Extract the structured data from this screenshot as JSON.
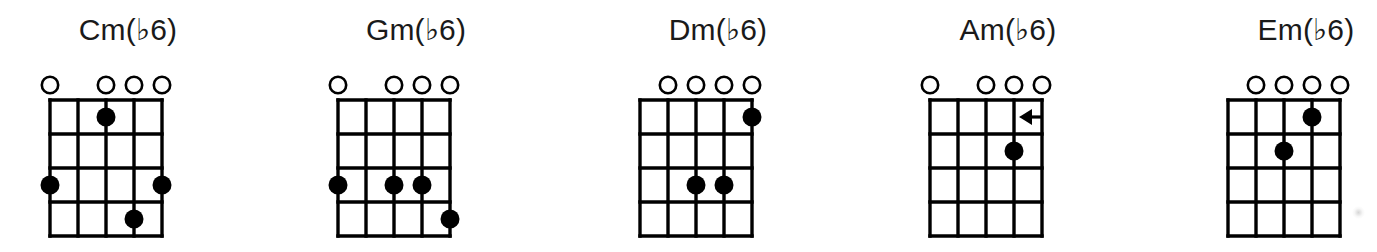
{
  "figure": {
    "title_visible": false,
    "accent_color": "#000000",
    "background_color": "#ffffff",
    "text_color": "#1a1a1a"
  },
  "chart_data": {
    "type": "table",
    "title": "",
    "subtitle": "",
    "xlabel": "",
    "ylabel": "",
    "grid": true,
    "legend_position": "none",
    "notation": "guitar chord diagram grid",
    "strings_count": 5,
    "frets_count": 4,
    "marker_legend": {
      "open_circle": "open string (played unfretted)",
      "filled_dot": "fretted note",
      "left_arrow": "slide / approach note from above"
    },
    "categories": [
      "Cm(b6)",
      "Gm(b6)",
      "Dm(b6)",
      "Am(b6)",
      "Em(b6)"
    ],
    "series": [
      {
        "name": "open_strings_count",
        "values": [
          4,
          4,
          4,
          4,
          4
        ]
      },
      {
        "name": "fretted_notes_count",
        "values": [
          4,
          4,
          3,
          1,
          2
        ]
      }
    ],
    "diagrams": [
      {
        "name": "Cm(b6)",
        "open_strings": [
          1,
          3,
          4,
          5
        ],
        "dots": [
          {
            "fret": 1,
            "string": 3
          },
          {
            "fret": 3,
            "string": 1
          },
          {
            "fret": 3,
            "string": 5
          },
          {
            "fret": 4,
            "string": 4
          }
        ],
        "arrows": []
      },
      {
        "name": "Gm(b6)",
        "open_strings": [
          1,
          3,
          4,
          5
        ],
        "dots": [
          {
            "fret": 3,
            "string": 1
          },
          {
            "fret": 3,
            "string": 3
          },
          {
            "fret": 3,
            "string": 4
          },
          {
            "fret": 4,
            "string": 5
          }
        ],
        "arrows": []
      },
      {
        "name": "Dm(b6)",
        "open_strings": [
          2,
          3,
          4,
          5
        ],
        "dots": [
          {
            "fret": 1,
            "string": 5
          },
          {
            "fret": 3,
            "string": 3
          },
          {
            "fret": 3,
            "string": 4
          }
        ],
        "arrows": []
      },
      {
        "name": "Am(b6)",
        "open_strings": [
          1,
          3,
          4,
          5
        ],
        "dots": [
          {
            "fret": 2,
            "string": 4
          }
        ],
        "arrows": [
          {
            "fret": 1,
            "from_string": 5,
            "to_string": 4,
            "direction": "left"
          }
        ]
      },
      {
        "name": "Em(b6)",
        "open_strings": [
          2,
          3,
          4,
          5
        ],
        "dots": [
          {
            "fret": 1,
            "string": 4
          },
          {
            "fret": 2,
            "string": 3
          }
        ],
        "arrows": []
      }
    ]
  },
  "chords": [
    {
      "id": "chord-cm-flat6",
      "title": "Cm(♭6)",
      "left": 38,
      "open_strings": [
        1,
        3,
        4,
        5
      ],
      "dots": [
        {
          "fret": 1,
          "string": 3
        },
        {
          "fret": 3,
          "string": 1
        },
        {
          "fret": 3,
          "string": 5
        },
        {
          "fret": 4,
          "string": 4
        }
      ],
      "arrows": []
    },
    {
      "id": "chord-gm-flat6",
      "title": "Gm(♭6)",
      "left": 326,
      "open_strings": [
        1,
        3,
        4,
        5
      ],
      "dots": [
        {
          "fret": 3,
          "string": 1
        },
        {
          "fret": 3,
          "string": 3
        },
        {
          "fret": 3,
          "string": 4
        },
        {
          "fret": 4,
          "string": 5
        }
      ],
      "arrows": []
    },
    {
      "id": "chord-dm-flat6",
      "title": "Dm(♭6)",
      "left": 628,
      "open_strings": [
        2,
        3,
        4,
        5
      ],
      "dots": [
        {
          "fret": 1,
          "string": 5
        },
        {
          "fret": 3,
          "string": 3
        },
        {
          "fret": 3,
          "string": 4
        }
      ],
      "arrows": []
    },
    {
      "id": "chord-am-flat6",
      "title": "Am(♭6)",
      "left": 918,
      "open_strings": [
        1,
        3,
        4,
        5
      ],
      "dots": [
        {
          "fret": 2,
          "string": 4
        }
      ],
      "arrows": [
        {
          "fret": 1,
          "string": 5,
          "direction": "left"
        }
      ]
    },
    {
      "id": "chord-em-flat6",
      "title": "Em(♭6)",
      "left": 1216,
      "open_strings": [
        2,
        3,
        4,
        5
      ],
      "dots": [
        {
          "fret": 1,
          "string": 4
        },
        {
          "fret": 2,
          "string": 3
        }
      ],
      "arrows": []
    }
  ]
}
